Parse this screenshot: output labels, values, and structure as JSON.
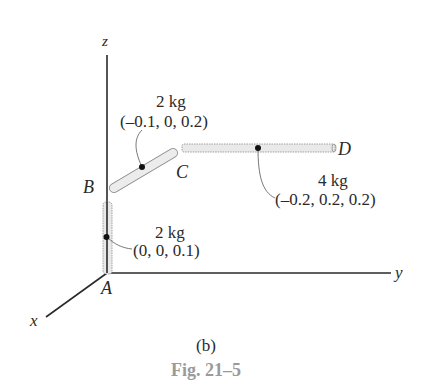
{
  "axes": {
    "x": "x",
    "y": "y",
    "z": "z"
  },
  "points": {
    "A": "A",
    "B": "B",
    "C": "C",
    "D": "D"
  },
  "rods": [
    {
      "segment": "AB",
      "mass": "2 kg",
      "center": "(0, 0, 0.1)"
    },
    {
      "segment": "BC",
      "mass": "2 kg",
      "center": "(–0.1, 0, 0.2)"
    },
    {
      "segment": "CD",
      "mass": "4 kg",
      "center": "(–0.2, 0.2, 0.2)"
    }
  ],
  "subfigure": "(b)",
  "caption": "Fig. 21–5",
  "colors": {
    "line": "#2a2a2a",
    "rod_fill": "#e9e9e9",
    "rod_edge": "#8a8a8a",
    "caption": "#9a9a9a"
  }
}
